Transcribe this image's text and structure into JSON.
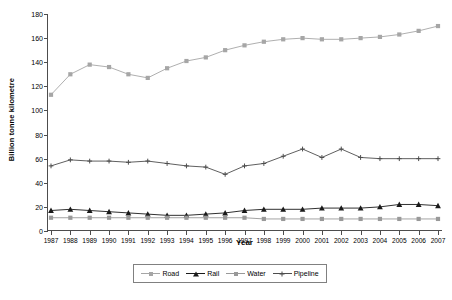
{
  "chart_data": {
    "type": "line",
    "title": "",
    "xlabel": "Year",
    "ylabel": "Billion tonne kilometre",
    "xlim": [
      1987,
      2007
    ],
    "ylim": [
      0,
      180
    ],
    "ytick_step": 20,
    "grid": false,
    "legend_position": "bottom",
    "categories": [
      "1987",
      "1988",
      "1989",
      "1990",
      "1991",
      "1992",
      "1993",
      "1994",
      "1995",
      "1996",
      "1997",
      "1998",
      "1999",
      "2000",
      "2001",
      "2002",
      "2003",
      "2004",
      "2005",
      "2006",
      "2007"
    ],
    "ytick_labels": [
      "0",
      "20",
      "40",
      "60",
      "80",
      "100",
      "120",
      "140",
      "160",
      "180"
    ],
    "series": [
      {
        "name": "Road",
        "color": "#a6a6a6",
        "marker": "square",
        "values": [
          113,
          130,
          138,
          136,
          130,
          127,
          135,
          141,
          144,
          150,
          154,
          157,
          159,
          160,
          159,
          159,
          160,
          161,
          163,
          166,
          170
        ]
      },
      {
        "name": "Rail",
        "color": "#1a1a1a",
        "marker": "triangle",
        "values": [
          17,
          18,
          17,
          16,
          15,
          14,
          13,
          13,
          14,
          15,
          17,
          18,
          18,
          18,
          19,
          19,
          19,
          20,
          22,
          22,
          21
        ]
      },
      {
        "name": "Water",
        "color": "#999999",
        "marker": "square",
        "values": [
          11,
          11,
          11,
          11,
          11,
          11,
          11,
          11,
          11,
          11,
          11,
          10,
          10,
          10,
          10,
          10,
          10,
          10,
          10,
          10,
          10
        ]
      },
      {
        "name": "Pipeline",
        "color": "#4d4d4d",
        "marker": "plus",
        "values": [
          54,
          59,
          58,
          58,
          57,
          58,
          56,
          54,
          53,
          47,
          54,
          56,
          62,
          68,
          61,
          68,
          61,
          60,
          60,
          60,
          60
        ]
      }
    ]
  }
}
